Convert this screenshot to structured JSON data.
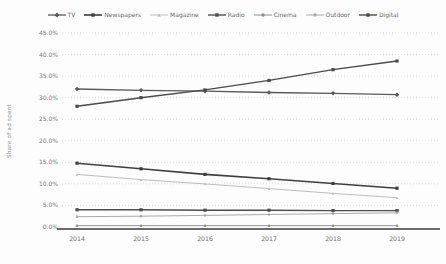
{
  "chart_data": {
    "type": "line",
    "title": "",
    "xlabel": "",
    "ylabel": "Share of ad spent",
    "x": [
      "2014",
      "2015",
      "2016",
      "2017",
      "2018",
      "2019"
    ],
    "ylim": [
      0,
      45
    ],
    "ytick_step": 5,
    "ytick_labels": [
      "0.0%",
      "5.0%",
      "10.0%",
      "15.0%",
      "20.0%",
      "25.0%",
      "30.0%",
      "35.0%",
      "40.0%",
      "45.0%"
    ],
    "grid": "horizontal-dotted",
    "legend_position": "top-center",
    "axis_color": "#6b6b6b",
    "gridline_color": "#cfcfcf",
    "tick_label_color": "#7a7a7a",
    "series": [
      {
        "name": "TV",
        "color": "#595959",
        "marker": "diamond",
        "line_width": 1.3,
        "values": [
          32.0,
          31.7,
          31.5,
          31.2,
          31.0,
          30.7
        ]
      },
      {
        "name": "Newspapers",
        "color": "#3f3f3f",
        "marker": "square",
        "line_width": 1.6,
        "values": [
          14.8,
          13.5,
          12.2,
          11.2,
          10.1,
          9.0
        ]
      },
      {
        "name": "Magazine",
        "color": "#bdbdbd",
        "marker": "triangle",
        "line_width": 1.0,
        "values": [
          12.2,
          11.0,
          10.0,
          8.9,
          7.8,
          6.8
        ]
      },
      {
        "name": "Radio",
        "color": "#4d4d4d",
        "marker": "square",
        "line_width": 1.4,
        "values": [
          4.0,
          4.0,
          3.9,
          3.9,
          3.8,
          3.8
        ]
      },
      {
        "name": "Cinema",
        "color": "#8f8f8f",
        "marker": "circle",
        "line_width": 1.0,
        "values": [
          0.3,
          0.3,
          0.3,
          0.3,
          0.3,
          0.3
        ]
      },
      {
        "name": "Outdoor",
        "color": "#ababab",
        "marker": "circle",
        "line_width": 1.0,
        "values": [
          2.4,
          2.5,
          2.7,
          2.9,
          3.1,
          3.3
        ]
      },
      {
        "name": "Digital",
        "color": "#4a4a4a",
        "marker": "square",
        "line_width": 1.4,
        "values": [
          28.0,
          30.0,
          31.8,
          34.0,
          36.5,
          38.5
        ]
      }
    ]
  }
}
